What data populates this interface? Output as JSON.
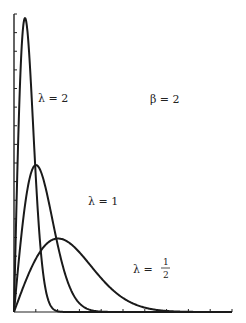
{
  "chart_data": {
    "type": "line",
    "title": "",
    "xlabel": "",
    "ylabel": "",
    "annotation": "β = 2",
    "xlim": [
      0,
      7
    ],
    "ylim": [
      0,
      1.75
    ],
    "grid": false,
    "x_ticks_count": 10,
    "y_ticks_count": 16,
    "series": [
      {
        "name": "λ = 2",
        "lambda": 2,
        "label": "λ = 2",
        "x": [
          0,
          0.1,
          0.2,
          0.3,
          0.354,
          0.4,
          0.5,
          0.6,
          0.8,
          1.0,
          1.2,
          1.5
        ],
        "values": [
          0,
          0.384,
          0.681,
          0.838,
          0.858,
          0.852,
          0.736,
          0.569,
          0.237,
          0.073,
          0.015,
          0.0007
        ]
      },
      {
        "name": "λ = 1",
        "lambda": 1,
        "label": "λ = 1",
        "x": [
          0,
          0.2,
          0.4,
          0.6,
          0.707,
          0.8,
          1.0,
          1.3,
          1.6,
          2.0,
          2.5,
          3.0
        ],
        "values": [
          0,
          0.384,
          0.681,
          0.838,
          0.858,
          0.843,
          0.736,
          0.481,
          0.247,
          0.073,
          0.01,
          0.0007
        ]
      },
      {
        "name": "λ = 1/2",
        "lambda": 0.5,
        "label": "λ = 1/2",
        "x": [
          0,
          0.5,
          1.0,
          1.414,
          2.0,
          2.5,
          3.0,
          4.0,
          5.0,
          6.0,
          7.0
        ],
        "values": [
          0,
          0.235,
          0.389,
          0.429,
          0.368,
          0.262,
          0.158,
          0.037,
          0.005,
          0.0004,
          1e-05
        ]
      }
    ]
  },
  "labels": {
    "beta": "β = 2",
    "lambda2": "λ = 2",
    "lambda1": "λ = 1",
    "lambda_half_prefix": "λ =",
    "lambda_half_num": "1",
    "lambda_half_den": "2"
  }
}
